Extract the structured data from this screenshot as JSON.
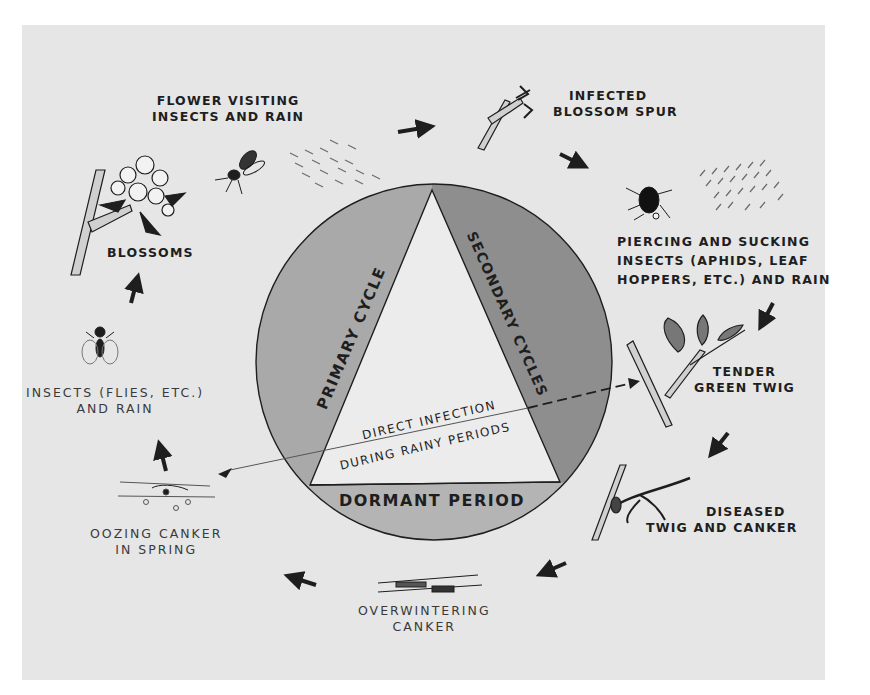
{
  "diagram": {
    "type": "disease-cycle",
    "title_center": {
      "primary": "PRIMARY CYCLE",
      "secondary": "SECONDARY CYCLES",
      "dormant": "DORMANT PERIOD",
      "direct_line1": "DIRECT INFECTION",
      "direct_line2": "DURING RAINY PERIODS"
    },
    "stages": [
      {
        "id": "blossoms",
        "lines": [
          "BLOSSOMS"
        ]
      },
      {
        "id": "flower-visiting",
        "lines": [
          "FLOWER VISITING",
          "INSECTS AND RAIN"
        ]
      },
      {
        "id": "infected-spur",
        "lines": [
          "INFECTED",
          "BLOSSOM SPUR"
        ]
      },
      {
        "id": "piercing",
        "lines": [
          "PIERCING AND SUCKING",
          "INSECTS (APHIDS, LEAF",
          "HOPPERS, ETC.) AND RAIN"
        ]
      },
      {
        "id": "tender-twig",
        "lines": [
          "TENDER",
          "GREEN TWIG"
        ]
      },
      {
        "id": "diseased-twig",
        "lines": [
          "DISEASED",
          "TWIG AND CANKER"
        ]
      },
      {
        "id": "overwintering",
        "lines": [
          "OVERWINTERING",
          "CANKER"
        ]
      },
      {
        "id": "oozing",
        "lines": [
          "OOZING CANKER",
          "IN SPRING"
        ]
      },
      {
        "id": "insects-flies",
        "lines": [
          "INSECTS (FLIES, ETC.)",
          "AND RAIN"
        ]
      }
    ],
    "colors": {
      "background": "#e6e6e6",
      "segment_primary": "#a9a9a9",
      "segment_secondary": "#8e8e8e",
      "segment_dormant": "#b4b4b4",
      "triangle": "#ececec",
      "ink": "#1e1e1e"
    }
  }
}
